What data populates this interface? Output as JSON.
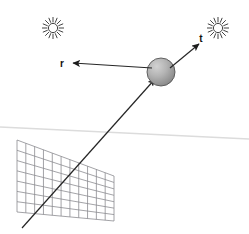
{
  "figure": {
    "background_color": "#ffffff",
    "width": 249,
    "height": 234
  },
  "labels": {
    "reflected_vector": "r",
    "transmitted_vector": "t"
  },
  "objects": {
    "sphere": {
      "name": "sphere",
      "center_x": 161,
      "center_y": 72,
      "radius": 14,
      "fill_light": "#c8c8c8",
      "fill_dark": "#8a8a8a",
      "stroke": "#4a4a4a"
    },
    "grid_plane": {
      "name": "image-plane-grid",
      "columns": 11,
      "rows": 7,
      "stroke": "#8c8c90",
      "top_left_x": 17,
      "top_left_y": 140,
      "top_right_x": 114,
      "top_right_y": 176,
      "bottom_left_x": 17,
      "bottom_left_y": 212,
      "bottom_right_x": 114,
      "bottom_right_y": 221
    },
    "horizon": {
      "name": "horizon-line",
      "stroke": "#dcdcdc",
      "x1": 0,
      "y1": 127,
      "x2": 249,
      "y2": 139
    },
    "light_left": {
      "name": "light-source-left",
      "center_x": 53,
      "center_y": 28,
      "inner_radius": 4.6,
      "outer_radius": 11,
      "spikes": 16,
      "stroke": "#3a3a3a"
    },
    "light_right": {
      "name": "light-source-right",
      "center_x": 218,
      "center_y": 28,
      "inner_radius": 4.6,
      "outer_radius": 11,
      "spikes": 16,
      "stroke": "#3a3a3a"
    }
  },
  "rays": {
    "incident": {
      "name": "incident-ray",
      "from_x": 22,
      "from_y": 228,
      "to_x": 155,
      "to_y": 79,
      "stroke": "#262626",
      "arrowhead": true
    },
    "reflected": {
      "name": "reflected-ray",
      "from_x": 152,
      "from_y": 68,
      "to_x": 73,
      "to_y": 63,
      "stroke": "#262626",
      "arrowhead": true
    },
    "transmitted": {
      "name": "transmitted-ray",
      "from_x": 170,
      "from_y": 68,
      "to_x": 199,
      "to_y": 44,
      "stroke": "#262626",
      "arrowhead": true
    }
  },
  "label_positions": {
    "r": {
      "x": 62,
      "y": 67
    },
    "t": {
      "x": 201,
      "y": 42
    }
  }
}
